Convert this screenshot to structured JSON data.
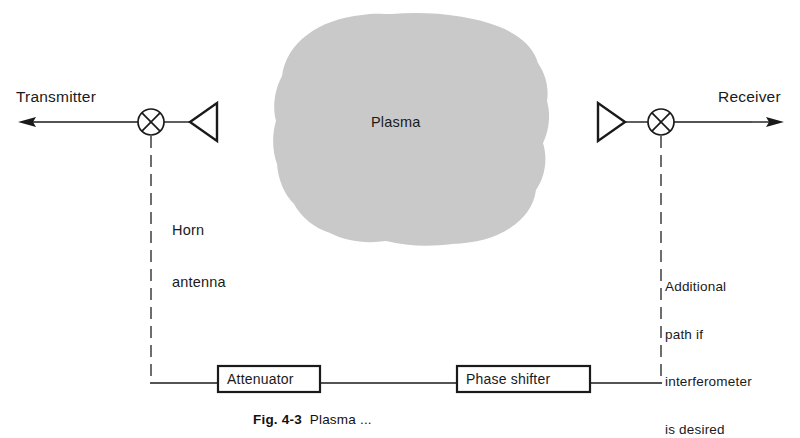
{
  "figure": {
    "caption_label": "Fig. 4-3",
    "caption_text": "  Plasma ...",
    "background_color": "#ffffff",
    "line_color": "#1a1a1a"
  },
  "diagram": {
    "type": "block-diagram",
    "plasma": {
      "label": "Plasma",
      "fill_color": "#c9c9c9",
      "shape": "irregular-rounded-blob"
    },
    "endpoints": [
      {
        "name": "transmitter",
        "label": "Transmitter",
        "arrow_direction": "left",
        "side": "left"
      },
      {
        "name": "receiver",
        "label": "Receiver",
        "arrow_direction": "right",
        "side": "right"
      }
    ],
    "components": [
      {
        "name": "mixer-left",
        "type": "mixer",
        "symbol": "circle-with-x",
        "side": "left"
      },
      {
        "name": "horn-antenna-left",
        "type": "horn-antenna",
        "symbol": "triangle",
        "points": "left",
        "side": "left"
      },
      {
        "name": "horn-antenna-right",
        "type": "horn-antenna",
        "symbol": "triangle",
        "points": "right",
        "side": "right"
      },
      {
        "name": "mixer-right",
        "type": "mixer",
        "symbol": "circle-with-x",
        "side": "right"
      },
      {
        "name": "attenuator",
        "type": "box",
        "label": "Attenuator"
      },
      {
        "name": "phase-shifter",
        "type": "box",
        "label": "Phase shifter"
      }
    ],
    "annotations": [
      {
        "name": "horn-antenna-note",
        "text": "Horn\nantenna",
        "line1": "Horn",
        "line2": "antenna"
      },
      {
        "name": "additional-path-note",
        "text": "Additional path if interferometer is desired",
        "line1": "Additional",
        "line2": "path if",
        "line3": "interferometer",
        "line4": "is desired"
      }
    ],
    "paths": [
      {
        "name": "signal-path-left",
        "style": "solid"
      },
      {
        "name": "signal-path-right",
        "style": "solid"
      },
      {
        "name": "reference-path-left",
        "style": "dashed"
      },
      {
        "name": "reference-path-right",
        "style": "dashed"
      },
      {
        "name": "reference-path-bottom",
        "style": "solid"
      }
    ]
  }
}
